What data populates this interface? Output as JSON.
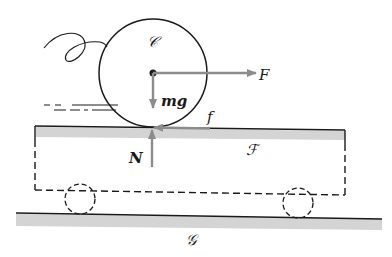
{
  "diagram": {
    "labels": {
      "cylinder": "𝒞",
      "gravity": "mg",
      "applied_force": "F",
      "friction": "f",
      "normal": "N",
      "frame": "ℱ",
      "ground": "𝒢"
    },
    "colors": {
      "line": "#1a1a1a",
      "arrow": "#8c8c8c",
      "surface_shade": "#d4d4d4"
    }
  }
}
